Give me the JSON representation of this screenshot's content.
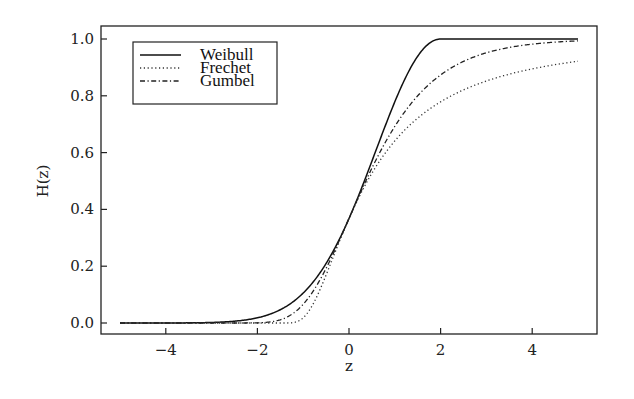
{
  "chart_data": {
    "type": "line",
    "title": "",
    "xlabel": "z",
    "ylabel": "H(z)",
    "xlim": [
      -5.4,
      5.4
    ],
    "ylim": [
      -0.04,
      1.05
    ],
    "xticks": [
      -4,
      -2,
      0,
      2,
      4
    ],
    "xtick_labels": [
      "−4",
      "−2",
      "0",
      "2",
      "4"
    ],
    "yticks": [
      0.0,
      0.2,
      0.4,
      0.6,
      0.8,
      1.0
    ],
    "ytick_labels": [
      "0.0",
      "0.2",
      "0.4",
      "0.6",
      "0.8",
      "1.0"
    ],
    "grid": false,
    "legend_position": "upper left",
    "x_range": [
      -5,
      5
    ],
    "series": [
      {
        "name": "Weibull",
        "xi": -0.5,
        "style": "solid",
        "color": "#111111",
        "x": [
          -5,
          -4,
          -3,
          -2,
          -1.5,
          -1,
          -0.5,
          0,
          0.5,
          1,
          1.5,
          2,
          3,
          4,
          5
        ],
        "values": [
          0.0,
          0.0,
          0.0,
          0.018,
          0.066,
          0.105,
          0.21,
          0.368,
          0.57,
          0.8,
          0.94,
          1.0,
          1.0,
          1.0,
          1.0
        ]
      },
      {
        "name": "Frechet",
        "xi": 0.5,
        "style": "dotted",
        "color": "#333333",
        "x": [
          -5,
          -2,
          -1.5,
          -1,
          -0.5,
          0,
          0.5,
          1,
          2,
          3,
          4,
          5
        ],
        "values": [
          0.0,
          0.0,
          0.0,
          0.018,
          0.17,
          0.368,
          0.527,
          0.641,
          0.78,
          0.85,
          0.895,
          0.922
        ]
      },
      {
        "name": "Gumbel",
        "xi": 0.0,
        "style": "dashdot",
        "color": "#222222",
        "x": [
          -5,
          -3,
          -2,
          -1.5,
          -1,
          -0.5,
          0,
          0.5,
          1,
          2,
          3,
          4,
          5
        ],
        "values": [
          0.0,
          0.0,
          0.001,
          0.011,
          0.066,
          0.192,
          0.368,
          0.545,
          0.692,
          0.873,
          0.951,
          0.982,
          0.993
        ]
      }
    ]
  }
}
